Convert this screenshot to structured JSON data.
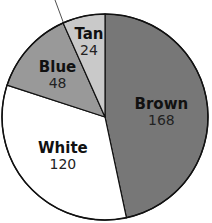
{
  "chart_data": {
    "type": "pie",
    "title": "",
    "unit": "degrees",
    "total": 360,
    "start_angle_deg": 0,
    "direction": "clockwise",
    "categories": [
      "Brown",
      "White",
      "Blue",
      "Tan"
    ],
    "values": [
      168,
      120,
      48,
      24
    ],
    "colors": [
      "#777777",
      "#ffffff",
      "#999999",
      "#c9c9c9"
    ],
    "labels": [
      {
        "name": "Brown",
        "value": "168"
      },
      {
        "name": "White",
        "value": "120"
      },
      {
        "name": "Blue",
        "value": "48"
      },
      {
        "name": "Tan",
        "value": "24"
      }
    ],
    "legend": "none (labels inside slices)"
  }
}
